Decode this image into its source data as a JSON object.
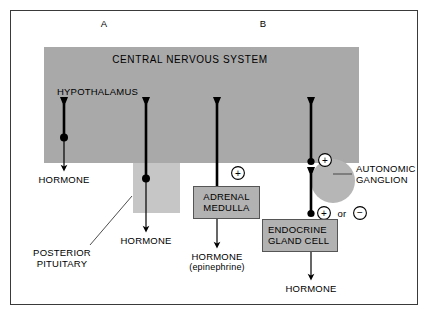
{
  "figure": {
    "panels": [
      {
        "id": "A",
        "label": "A"
      },
      {
        "id": "B",
        "label": "B"
      }
    ],
    "cns": {
      "title": "CENTRAL NERVOUS SYSTEM",
      "region_label": "HYPOTHALAMUS"
    },
    "structures": {
      "posterior_pituitary": "POSTERIOR\nPITUITARY",
      "posterior_pituitary_line1": "POSTERIOR",
      "posterior_pituitary_line2": "PITUITARY",
      "adrenal_medulla_line1": "ADRENAL",
      "adrenal_medulla_line2": "MEDULLA",
      "autonomic_ganglion_line1": "AUTONOMIC",
      "autonomic_ganglion_line2": "GANGLION",
      "endocrine_gland_cell_line1": "ENDOCRINE",
      "endocrine_gland_cell_line2": "GLAND CELL"
    },
    "outputs": {
      "hormone_1": "HORMONE",
      "hormone_2": "HORMONE",
      "hormone_3": "HORMONE",
      "hormone_3_sub": "(epinephrine)",
      "hormone_4": "HORMONE"
    },
    "signs": {
      "adrenal_plus": "+",
      "ganglion_plus": "+",
      "endocrine_plus": "+",
      "endocrine_or": "or",
      "endocrine_minus": "−"
    },
    "colors": {
      "cns_band": "#a9a9a9",
      "posterior_pituitary": "#c6c6c6",
      "ganglion": "#b6b6b6",
      "box_fill": "#b2b2b2",
      "box_border": "#555555",
      "frame_border": "#3a3a3a",
      "line": "#000000",
      "background": "#ffffff"
    }
  }
}
